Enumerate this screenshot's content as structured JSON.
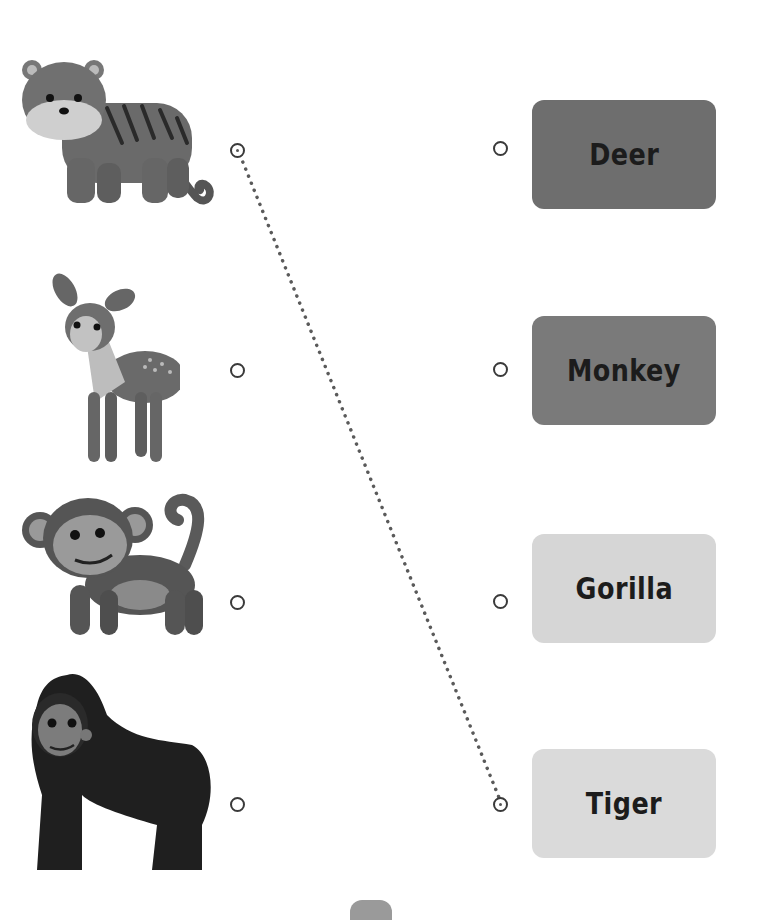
{
  "worksheet": {
    "type": "match-the-animals",
    "animals": [
      {
        "name": "tiger",
        "circle_connected": true
      },
      {
        "name": "deer",
        "circle_connected": false
      },
      {
        "name": "monkey",
        "circle_connected": false
      },
      {
        "name": "gorilla",
        "circle_connected": false
      }
    ],
    "labels": [
      {
        "text": "Deer",
        "color": "#6e6e6e"
      },
      {
        "text": "Monkey",
        "color": "#7a7a7a"
      },
      {
        "text": "Gorilla",
        "color": "#d6d6d6"
      },
      {
        "text": "Tiger",
        "color": "#dadada"
      }
    ],
    "connection": {
      "from": "tiger",
      "to": "Tiger",
      "style": "dotted"
    }
  },
  "colors": {
    "circle_stroke": "#3a3a3a",
    "dotted_line": "#5a5a5a",
    "page_tab": "#9a9a9a"
  }
}
